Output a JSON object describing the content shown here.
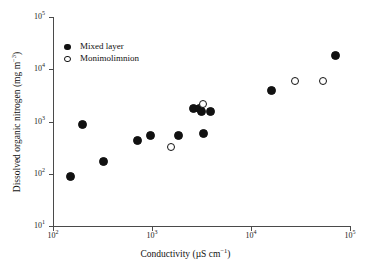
{
  "chart_data": {
    "type": "scatter",
    "title": "",
    "xlabel": "Conductivity (µS cm−1)",
    "ylabel": "Dissolved organic nitrogen (mg m−3)",
    "xscale": "log",
    "yscale": "log",
    "xlim": [
      100,
      100000
    ],
    "ylim": [
      10,
      100000
    ],
    "grid": false,
    "legend_position": "upper-left",
    "xticks": [
      {
        "value": 100,
        "label": "10",
        "exponent": "2"
      },
      {
        "value": 1000,
        "label": "10",
        "exponent": "3"
      },
      {
        "value": 10000,
        "label": "10",
        "exponent": "4"
      },
      {
        "value": 100000,
        "label": "10",
        "exponent": "5"
      }
    ],
    "yticks": [
      {
        "value": 10,
        "label": "10",
        "exponent": "1"
      },
      {
        "value": 100,
        "label": "10",
        "exponent": "2"
      },
      {
        "value": 1000,
        "label": "10",
        "exponent": "3"
      },
      {
        "value": 10000,
        "label": "10",
        "exponent": "4"
      },
      {
        "value": 100000,
        "label": "10",
        "exponent": "5"
      }
    ],
    "series": [
      {
        "name": "Mixed layer",
        "marker": "filled-circle",
        "color": "#111111",
        "points": [
          {
            "x": 150,
            "y": 90
          },
          {
            "x": 200,
            "y": 880
          },
          {
            "x": 320,
            "y": 175
          },
          {
            "x": 720,
            "y": 430
          },
          {
            "x": 960,
            "y": 540
          },
          {
            "x": 1850,
            "y": 540
          },
          {
            "x": 2600,
            "y": 1750
          },
          {
            "x": 3000,
            "y": 1800
          },
          {
            "x": 3150,
            "y": 1550
          },
          {
            "x": 3300,
            "y": 580
          },
          {
            "x": 3900,
            "y": 1520
          },
          {
            "x": 16000,
            "y": 3900
          },
          {
            "x": 72000,
            "y": 18500
          }
        ]
      },
      {
        "name": "Monimolimnion",
        "marker": "open-circle",
        "color": "#111111",
        "points": [
          {
            "x": 1550,
            "y": 330
          },
          {
            "x": 3300,
            "y": 2200
          },
          {
            "x": 28000,
            "y": 5900
          },
          {
            "x": 53000,
            "y": 6000
          }
        ]
      }
    ]
  },
  "axis_titles": {
    "x_main": "Conductivity (",
    "x_unit": "µS cm",
    "x_unit_sup": "−1",
    "x_close": ")",
    "y_main": "Dissolved organic nitrogen (mg m",
    "y_sup": "−3",
    "y_close": ")"
  },
  "legend": {
    "items": [
      {
        "label": "Mixed layer",
        "marker": "filled-circle"
      },
      {
        "label": "Monimolimnion",
        "marker": "open-circle"
      }
    ]
  }
}
